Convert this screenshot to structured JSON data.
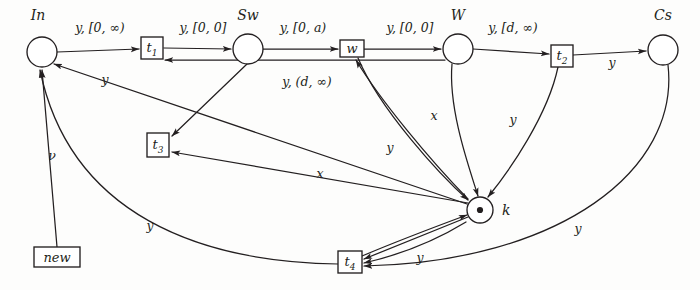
{
  "figure": {
    "ink_color": "#231f20",
    "background_color": "#fdfdfc",
    "width": 700,
    "height": 290
  },
  "places": [
    {
      "id": "In",
      "label": "In",
      "cx": 42,
      "cy": 52,
      "r": 15,
      "token": false,
      "label_dx": -4,
      "label_dy": -34
    },
    {
      "id": "Sw",
      "label": "Sw",
      "cx": 248,
      "cy": 49,
      "r": 15,
      "token": false,
      "label_dx": 0,
      "label_dy": -34
    },
    {
      "id": "W",
      "label": "W",
      "cx": 458,
      "cy": 49,
      "r": 15,
      "token": false,
      "label_dx": 0,
      "label_dy": -34
    },
    {
      "id": "Cs",
      "label": "Cs",
      "cx": 663,
      "cy": 50,
      "r": 15,
      "token": false,
      "label_dx": 0,
      "label_dy": -34
    },
    {
      "id": "k",
      "label": "k",
      "cx": 480,
      "cy": 210,
      "r": 13,
      "token": true,
      "label_dx": 26,
      "label_dy": 0
    }
  ],
  "transitions": [
    {
      "id": "t1",
      "label": "t",
      "sub": "1",
      "cx": 152,
      "cy": 48,
      "w": 22,
      "h": 22
    },
    {
      "id": "w",
      "label": "w",
      "sub": "",
      "cx": 352,
      "cy": 49,
      "w": 24,
      "h": 17
    },
    {
      "id": "t2",
      "label": "t",
      "sub": "2",
      "cx": 562,
      "cy": 56,
      "w": 22,
      "h": 22
    },
    {
      "id": "t3",
      "label": "t",
      "sub": "3",
      "cx": 158,
      "cy": 145,
      "w": 22,
      "h": 24
    },
    {
      "id": "t4",
      "label": "t",
      "sub": "4",
      "cx": 350,
      "cy": 262,
      "w": 24,
      "h": 22
    },
    {
      "id": "new",
      "label": "new",
      "sub": "",
      "cx": 57,
      "cy": 257,
      "w": 46,
      "h": 20
    }
  ],
  "arc_labels": [
    {
      "id": "in-t1",
      "text": "y, [0, ∞)",
      "x": 100,
      "y": 28,
      "align": "center"
    },
    {
      "id": "t1-sw",
      "text": "y, [0, 0]",
      "x": 203,
      "y": 28,
      "align": "center"
    },
    {
      "id": "sw-w",
      "text": "y, [0, a)",
      "x": 303,
      "y": 28,
      "align": "center"
    },
    {
      "id": "w-W",
      "text": "y, [0, 0]",
      "x": 408,
      "y": 28,
      "align": "center"
    },
    {
      "id": "W-t2",
      "text": "y, [d, ∞)",
      "x": 512,
      "y": 28,
      "align": "center"
    },
    {
      "id": "t2-cs",
      "text": "y",
      "x": 612,
      "y": 58,
      "align": "center"
    },
    {
      "id": "sw-t3",
      "text": "y, (d, ∞)",
      "x": 307,
      "y": 82,
      "align": "center"
    },
    {
      "id": "k-in",
      "text": "y",
      "x": 105,
      "y": 80,
      "align": "center"
    },
    {
      "id": "new-in",
      "text": "ν",
      "x": 50,
      "y": 157,
      "align": "center"
    },
    {
      "id": "t4-in",
      "text": "y",
      "x": 150,
      "y": 226,
      "align": "center"
    },
    {
      "id": "W-k",
      "text": "x",
      "x": 434,
      "y": 116,
      "align": "center"
    },
    {
      "id": "w-k",
      "text": "y",
      "x": 390,
      "y": 148,
      "align": "center"
    },
    {
      "id": "t2-k",
      "text": "y",
      "x": 513,
      "y": 120,
      "align": "center"
    },
    {
      "id": "k-t3",
      "text": "x",
      "x": 320,
      "y": 174,
      "align": "center"
    },
    {
      "id": "k-t4",
      "text": "y",
      "x": 420,
      "y": 258,
      "align": "center"
    },
    {
      "id": "cs-t4",
      "text": "y",
      "x": 578,
      "y": 229,
      "align": "center"
    }
  ],
  "arcs": [
    {
      "id": "in-to-t1",
      "from": "In",
      "to": "t1",
      "label": "y, [0, ∞)",
      "shape": "straight"
    },
    {
      "id": "t1-to-sw",
      "from": "t1",
      "to": "Sw",
      "label": "y, [0, 0]",
      "shape": "straight"
    },
    {
      "id": "sw-to-w",
      "from": "Sw",
      "to": "w",
      "label": "y, [0, a)",
      "shape": "straight"
    },
    {
      "id": "w-to-W",
      "from": "w",
      "to": "W",
      "label": "y, [0, 0]",
      "shape": "straight"
    },
    {
      "id": "W-to-t2",
      "from": "W",
      "to": "t2",
      "label": "y, [d, ∞)",
      "shape": "straight"
    },
    {
      "id": "t2-to-cs",
      "from": "t2",
      "to": "Cs",
      "label": "y",
      "shape": "straight"
    },
    {
      "id": "sw-to-t3",
      "from": "Sw",
      "to": "t3",
      "label": "y, (d, ∞)",
      "shape": "straight"
    },
    {
      "id": "W-to-t1",
      "from": "W",
      "to": "t1",
      "label": "",
      "shape": "straight"
    },
    {
      "id": "k-to-in",
      "from": "k",
      "to": "In",
      "label": "y",
      "shape": "straight"
    },
    {
      "id": "new-to-in",
      "from": "new",
      "to": "In",
      "label": "ν",
      "shape": "straight"
    },
    {
      "id": "t4-to-in",
      "from": "t4",
      "to": "In",
      "label": "y",
      "shape": "curve"
    },
    {
      "id": "W-to-k",
      "from": "W",
      "to": "k",
      "label": "x",
      "shape": "curve"
    },
    {
      "id": "w-to-k",
      "from": "w",
      "to": "k",
      "label": "y",
      "shape": "curve"
    },
    {
      "id": "t2-to-k",
      "from": "t2",
      "to": "k",
      "label": "y",
      "shape": "curve"
    },
    {
      "id": "k-to-t3",
      "from": "k",
      "to": "t3",
      "label": "x",
      "shape": "straight"
    },
    {
      "id": "k-to-w",
      "from": "k",
      "to": "w",
      "label": "",
      "shape": "curve"
    },
    {
      "id": "t4-to-k",
      "from": "t4",
      "to": "k",
      "label": "y",
      "shape": "curve"
    },
    {
      "id": "k-to-t4",
      "from": "k",
      "to": "t4",
      "label": "",
      "shape": "straight"
    },
    {
      "id": "cs-to-t4",
      "from": "Cs",
      "to": "t4",
      "label": "y",
      "shape": "curve"
    },
    {
      "id": "t3-in-a",
      "from": "k",
      "to": "t3",
      "label": "",
      "shape": "straight"
    }
  ]
}
